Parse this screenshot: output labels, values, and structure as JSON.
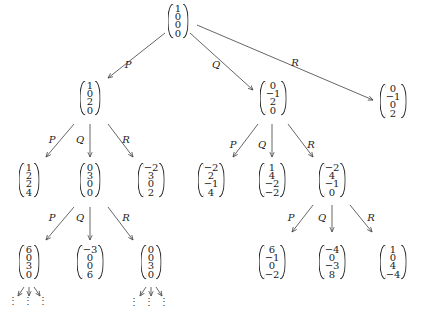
{
  "nodes": [
    {
      "id": "root",
      "x": 178,
      "y": 21,
      "v": [
        "1",
        "0",
        "0",
        "0"
      ]
    },
    {
      "id": "P",
      "x": 90,
      "y": 98,
      "v": [
        "1",
        "0",
        "2",
        "0"
      ]
    },
    {
      "id": "Q",
      "x": 273,
      "y": 98,
      "v": [
        "0",
        "−1",
        "2",
        "0"
      ]
    },
    {
      "id": "R",
      "x": 393,
      "y": 101,
      "v": [
        "0",
        "−1",
        "0",
        "2"
      ]
    },
    {
      "id": "PP",
      "x": 29,
      "y": 180,
      "v": [
        "1",
        "2",
        "2",
        "4"
      ]
    },
    {
      "id": "PQ",
      "x": 90,
      "y": 180,
      "v": [
        "0",
        "3",
        "0",
        "0"
      ]
    },
    {
      "id": "PR",
      "x": 151,
      "y": 180,
      "v": [
        "−2",
        "3",
        "0",
        "2"
      ]
    },
    {
      "id": "QP",
      "x": 211,
      "y": 180,
      "v": [
        "−2",
        "2",
        "−1",
        "4"
      ]
    },
    {
      "id": "QQ",
      "x": 272,
      "y": 180,
      "v": [
        "1",
        "4",
        "−2",
        "−2"
      ]
    },
    {
      "id": "QR",
      "x": 332,
      "y": 180,
      "v": [
        "−2",
        "4",
        "−1",
        "0"
      ]
    },
    {
      "id": "PQP",
      "x": 29,
      "y": 262,
      "v": [
        "6",
        "0",
        "3",
        "0"
      ]
    },
    {
      "id": "PQQ",
      "x": 90,
      "y": 262,
      "v": [
        "−3",
        "0",
        "0",
        "6"
      ]
    },
    {
      "id": "PQR",
      "x": 151,
      "y": 262,
      "v": [
        "0",
        "0",
        "3",
        "0"
      ]
    },
    {
      "id": "QRP",
      "x": 272,
      "y": 262,
      "v": [
        "6",
        "−1",
        "0",
        "−2"
      ]
    },
    {
      "id": "QRQ",
      "x": 332,
      "y": 262,
      "v": [
        "−4",
        "0",
        "−3",
        "8"
      ]
    },
    {
      "id": "QRR",
      "x": 393,
      "y": 262,
      "v": [
        "1",
        "0",
        "4",
        "−4"
      ]
    }
  ],
  "edges": [
    {
      "x1": 165,
      "y1": 33,
      "x2": 108,
      "y2": 78,
      "label": "P",
      "lx": 128,
      "ly": 64
    },
    {
      "x1": 190,
      "y1": 33,
      "x2": 253,
      "y2": 90,
      "label": "Q",
      "lx": 216,
      "ly": 64
    },
    {
      "x1": 197,
      "y1": 25,
      "x2": 373,
      "y2": 100,
      "label": "R",
      "lx": 295,
      "ly": 62
    },
    {
      "x1": 74,
      "y1": 124,
      "x2": 46,
      "y2": 157,
      "label": "P",
      "lx": 52,
      "ly": 139
    },
    {
      "x1": 90,
      "y1": 124,
      "x2": 90,
      "y2": 157,
      "label": "Q",
      "lx": 80,
      "ly": 139
    },
    {
      "x1": 108,
      "y1": 124,
      "x2": 133,
      "y2": 157,
      "label": "R",
      "lx": 126,
      "ly": 139
    },
    {
      "x1": 258,
      "y1": 124,
      "x2": 233,
      "y2": 157,
      "label": "P",
      "lx": 233,
      "ly": 144
    },
    {
      "x1": 272,
      "y1": 124,
      "x2": 272,
      "y2": 157,
      "label": "Q",
      "lx": 262,
      "ly": 144
    },
    {
      "x1": 288,
      "y1": 124,
      "x2": 313,
      "y2": 157,
      "label": "R",
      "lx": 311,
      "ly": 144
    },
    {
      "x1": 74,
      "y1": 207,
      "x2": 46,
      "y2": 240,
      "label": "P",
      "lx": 52,
      "ly": 217
    },
    {
      "x1": 90,
      "y1": 207,
      "x2": 90,
      "y2": 240,
      "label": "Q",
      "lx": 80,
      "ly": 217
    },
    {
      "x1": 108,
      "y1": 207,
      "x2": 133,
      "y2": 240,
      "label": "R",
      "lx": 126,
      "ly": 217
    },
    {
      "x1": 313,
      "y1": 205,
      "x2": 292,
      "y2": 232,
      "label": "P",
      "lx": 291,
      "ly": 217
    },
    {
      "x1": 332,
      "y1": 205,
      "x2": 332,
      "y2": 232,
      "label": "Q",
      "lx": 322,
      "ly": 217
    },
    {
      "x1": 350,
      "y1": 205,
      "x2": 372,
      "y2": 232,
      "label": "R",
      "lx": 371,
      "ly": 217
    },
    {
      "x1": 24,
      "y1": 287,
      "x2": 18,
      "y2": 296,
      "label": "",
      "lx": 0,
      "ly": 0
    },
    {
      "x1": 29,
      "y1": 287,
      "x2": 29,
      "y2": 296,
      "label": "",
      "lx": 0,
      "ly": 0
    },
    {
      "x1": 34,
      "y1": 287,
      "x2": 40,
      "y2": 296,
      "label": "",
      "lx": 0,
      "ly": 0
    },
    {
      "x1": 146,
      "y1": 287,
      "x2": 140,
      "y2": 296,
      "label": "",
      "lx": 0,
      "ly": 0
    },
    {
      "x1": 151,
      "y1": 287,
      "x2": 151,
      "y2": 296,
      "label": "",
      "lx": 0,
      "ly": 0
    },
    {
      "x1": 156,
      "y1": 287,
      "x2": 162,
      "y2": 296,
      "label": "",
      "lx": 0,
      "ly": 0
    }
  ],
  "ellipses": [
    {
      "x": 13,
      "y": 302
    },
    {
      "x": 28,
      "y": 302
    },
    {
      "x": 43,
      "y": 302
    },
    {
      "x": 134,
      "y": 303
    },
    {
      "x": 149,
      "y": 303
    },
    {
      "x": 164,
      "y": 303
    }
  ],
  "ellipsis_glyph": "⋮"
}
